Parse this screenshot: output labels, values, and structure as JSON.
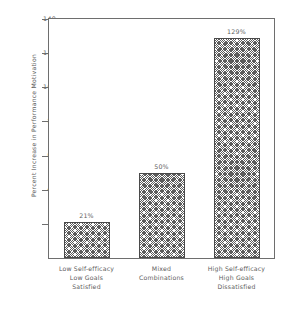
{
  "chart_data": {
    "type": "bar",
    "title": "",
    "xlabel": "",
    "ylabel": "Percent Increase in Performance Motivation",
    "ylim": [
      0,
      140
    ],
    "yticks": [
      20,
      40,
      60,
      80,
      100,
      120,
      140
    ],
    "ytick_labels": [
      "20",
      "40",
      "60",
      "80",
      "100",
      "120",
      "140"
    ],
    "grid": false,
    "legend": "none",
    "categories": [
      "Low Self-efficacy\nLow Goals\nSatisfied",
      "Mixed\nCombinations",
      "High Self-efficacy\nHigh Goals\nDissatisfied"
    ],
    "category_lines": [
      [
        "Low Self-efficacy",
        "Low Goals",
        "Satisfied"
      ],
      [
        "Mixed",
        "Combinations"
      ],
      [
        "High Self-efficacy",
        "High Goals",
        "Dissatisfied"
      ]
    ],
    "values": [
      21,
      50,
      129
    ],
    "data_labels": [
      "21%",
      "50%",
      "129%"
    ],
    "bar_fill": "crosshatch",
    "colors": {
      "bar_edge": "#4a4a4a",
      "bar_hatch": "#5c5c5c",
      "axis": "#6e6e6e",
      "text": "#5e5e5e",
      "background": "#ffffff"
    }
  }
}
